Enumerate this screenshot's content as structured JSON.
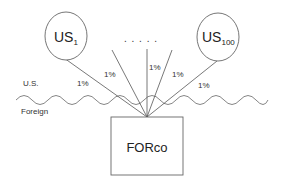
{
  "diagram": {
    "nodes": {
      "us_first": {
        "label": "US",
        "subscript": "1"
      },
      "us_last": {
        "label": "US",
        "subscript": "100"
      },
      "foreign_co": {
        "label": "FORco"
      }
    },
    "ellipsis": ". . . . .",
    "regions": {
      "upper": "U.S.",
      "lower": "Foreign"
    },
    "edges": [
      {
        "label": "1%"
      },
      {
        "label": "1%"
      },
      {
        "label": "1%"
      },
      {
        "label": "1%"
      },
      {
        "label": "1%"
      }
    ],
    "colors": {
      "stroke": "#666666",
      "text": "#333333",
      "background": "#ffffff"
    }
  }
}
